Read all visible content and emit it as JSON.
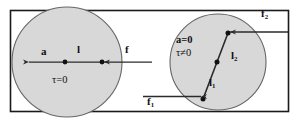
{
  "figure": {
    "frame": {
      "stroke": "#1a1a1a",
      "fill": "#ffffff"
    },
    "colors": {
      "disk_fill": "#d8d8d8",
      "disk_stroke": "#555555",
      "line": "#2b2b2b",
      "dot": "#111111",
      "text": "#111111",
      "background": "#ffffff"
    },
    "panels": [
      {
        "id": "left-panel",
        "name": "pure-translation-panel",
        "disk": {
          "cx": 67,
          "cy": 62,
          "r": 55
        },
        "center_dot": {
          "x": 65,
          "y": 62
        },
        "application_dot": {
          "x": 102,
          "y": 62
        },
        "labels": [
          {
            "id": "label-a",
            "text": "a",
            "bold": true,
            "x": 43,
            "y": 50
          },
          {
            "id": "label-l",
            "text": "l",
            "bold": true,
            "x": 78,
            "y": 48
          },
          {
            "id": "label-f",
            "text": "f",
            "bold": true,
            "x": 126,
            "y": 48
          },
          {
            "id": "label-tau-zero",
            "text": "τ=0",
            "bold": false,
            "x": 54,
            "y": 78
          }
        ]
      },
      {
        "id": "right-panel",
        "name": "pure-rotation-panel",
        "disk": {
          "cx": 218,
          "cy": 62,
          "r": 48
        },
        "vertex_dots": [
          {
            "x": 203,
            "y": 99
          },
          {
            "x": 217,
            "y": 62
          },
          {
            "x": 228,
            "y": 33
          }
        ],
        "labels": [
          {
            "id": "label-a-equals-0",
            "text": "a=0",
            "bold": true,
            "x": 178,
            "y": 39
          },
          {
            "id": "label-tau-nonzero",
            "text": "τ≠0",
            "bold": false,
            "x": 178,
            "y": 52
          },
          {
            "id": "label-l2",
            "base": "l",
            "subscript": "2",
            "bold": true,
            "x": 232,
            "y": 53
          },
          {
            "id": "label-l1",
            "base": "l",
            "subscript": "1",
            "bold": true,
            "x": 210,
            "y": 80
          },
          {
            "id": "label-f1",
            "base": "f",
            "subscript": "1",
            "bold": true,
            "x": 148,
            "y": 99
          },
          {
            "id": "label-f2",
            "base": "f",
            "subscript": "2",
            "bold": true,
            "x": 262,
            "y": 11
          }
        ]
      }
    ],
    "annotations": {
      "left_caption": "τ=0",
      "right_caption_acceleration": "a=0",
      "right_caption_torque": "τ≠0"
    }
  }
}
